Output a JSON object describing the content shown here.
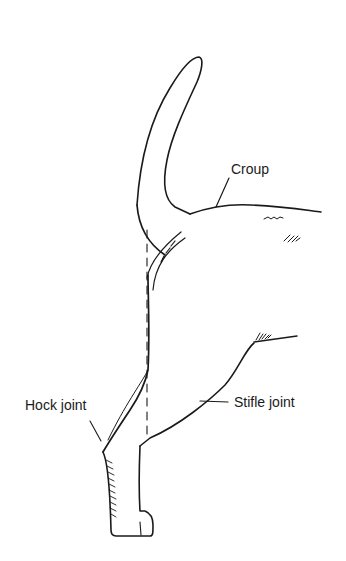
{
  "diagram": {
    "labels": {
      "croup": "Croup",
      "hock_joint": "Hock joint",
      "stifle_joint": "Stifle joint"
    },
    "colors": {
      "ink": "#1a1a1a",
      "background": "#ffffff"
    }
  }
}
